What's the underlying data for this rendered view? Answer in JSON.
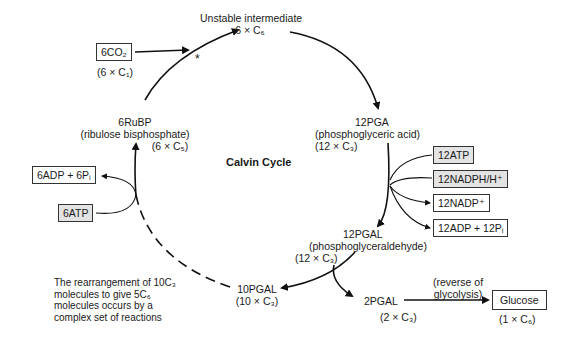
{
  "title": "Calvin Cycle",
  "nodes": {
    "unstable": {
      "name": "Unstable intermediate",
      "formula": "6 × C₆"
    },
    "pga": {
      "name": "12PGA",
      "desc": "(phosphoglyceric acid)",
      "formula": "(12 × C₃)"
    },
    "pgal": {
      "name": "12PGAL",
      "desc": "(phosphoglyceraldehyde)",
      "formula": "(12 × C₃)"
    },
    "pgal10": {
      "name": "10PGAL",
      "formula": "(10 × C₃)"
    },
    "pgal2": {
      "name": "2PGAL",
      "formula": "(2 × C₃)"
    },
    "rubp": {
      "name": "6RuBP",
      "desc": "(ribulose bisphosphate)",
      "formula": "(6 × C₅)"
    },
    "glucose": {
      "name": "Glucose",
      "formula": "(1 × C₆)"
    }
  },
  "inputs": {
    "co2": {
      "label": "6CO₂",
      "formula": "(6 × C₁)"
    },
    "atp12": "12ATP",
    "nadph": "12NADPH/H⁺",
    "nadp": "12NADP⁺",
    "adp12": "12ADP + 12Pᵢ",
    "adp6": "6ADP + 6Pᵢ",
    "atp6": "6ATP"
  },
  "annotations": {
    "asterisk": "*",
    "reverse": [
      "(reverse of",
      "glycolysis)"
    ],
    "rearrangement": [
      "The rearrangement of 10C₃",
      "molecules to give 5C₆",
      "molecules occurs by a",
      "complex set of reactions"
    ]
  }
}
